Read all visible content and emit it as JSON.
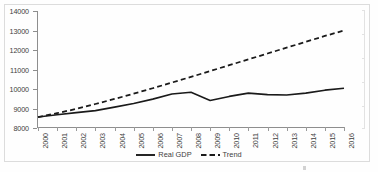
{
  "chart_data": {
    "type": "line",
    "title": "",
    "subtitle": "",
    "xlabel": "",
    "ylabel": "",
    "grid": false,
    "legend_position": "bottom",
    "x": [
      "2000",
      "2001",
      "2002",
      "2003",
      "2004",
      "2005",
      "2006",
      "2007",
      "2008",
      "2009",
      "2010",
      "2011",
      "2012",
      "2013",
      "2014",
      "2015",
      "2016"
    ],
    "categories": [
      "2000",
      "2001",
      "2002",
      "2003",
      "2004",
      "2005",
      "2006",
      "2007",
      "2008",
      "2009",
      "2010",
      "2011",
      "2012",
      "2013",
      "2014",
      "2015",
      "2016"
    ],
    "ylim": [
      8000,
      14000
    ],
    "ytick_labels": [
      "8000",
      "9000",
      "10000",
      "11000",
      "12000",
      "13000",
      "14000"
    ],
    "ytick_values": [
      8000,
      9000,
      10000,
      11000,
      12000,
      13000,
      14000
    ],
    "series": [
      {
        "name": "Real GDP",
        "style": "solid",
        "color": "#1a1a1a",
        "values": [
          8560,
          8680,
          8790,
          8890,
          9070,
          9260,
          9480,
          9740,
          9830,
          9410,
          9620,
          9790,
          9710,
          9690,
          9790,
          9940,
          10040
        ]
      },
      {
        "name": "Trend",
        "style": "dashed",
        "color": "#1a1a1a",
        "values": [
          8560,
          8760,
          8980,
          9230,
          9490,
          9760,
          10040,
          10330,
          10620,
          10920,
          11220,
          11520,
          11820,
          12120,
          12420,
          12720,
          13000
        ]
      }
    ]
  },
  "axes": {
    "y": {
      "labels": [
        "14000",
        "13000",
        "12000",
        "11000",
        "10000",
        "9000",
        "8000"
      ],
      "min": 8000,
      "max": 14000,
      "step": 1000
    },
    "x": {
      "labels": [
        "2000",
        "2001",
        "2002",
        "2003",
        "2004",
        "2005",
        "2006",
        "2007",
        "2008",
        "2009",
        "2010",
        "2011",
        "2012",
        "2013",
        "2014",
        "2015",
        "2016"
      ],
      "rotation": "-90"
    }
  },
  "legend": {
    "items": [
      {
        "label": "Real GDP",
        "style": "solid"
      },
      {
        "label": "Trend",
        "style": "dashed"
      }
    ]
  },
  "colors": {
    "line": "#1a1a1a",
    "axis": "#8e8e8e",
    "border": "#dcdcdc",
    "text": "#3d3d3d",
    "background": "#fefefe"
  }
}
